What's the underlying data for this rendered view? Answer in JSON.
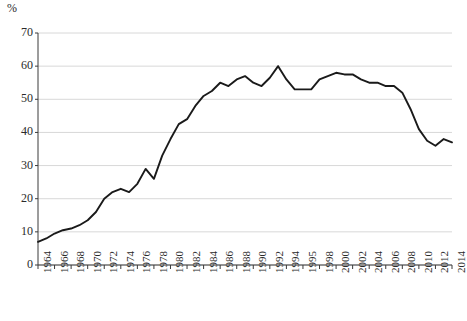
{
  "chart_data": {
    "type": "line",
    "title": "",
    "xlabel": "",
    "ylabel": "%",
    "ylim": [
      0,
      70
    ],
    "xlim": [
      1964,
      2014
    ],
    "grid": true,
    "legend": false,
    "y_ticks": [
      70,
      60,
      50,
      40,
      30,
      20,
      10,
      0
    ],
    "x_tick_labels": [
      "1964",
      "1966",
      "1968",
      "1970",
      "1972",
      "1974",
      "1976",
      "1978",
      "1980",
      "1982",
      "1984",
      "1986",
      "1988",
      "1990",
      "1992",
      "1994",
      "1995",
      "1998",
      "2000",
      "2002",
      "2004",
      "2006",
      "2008",
      "2010",
      "2012",
      "2014"
    ],
    "line_color": "#1a1a1a",
    "grid_color": "#d8d8d8",
    "x": [
      1964,
      1965,
      1966,
      1967,
      1968,
      1969,
      1970,
      1971,
      1972,
      1973,
      1974,
      1975,
      1976,
      1977,
      1978,
      1979,
      1980,
      1981,
      1982,
      1983,
      1984,
      1985,
      1986,
      1987,
      1988,
      1989,
      1990,
      1991,
      1992,
      1993,
      1994,
      1995,
      1996,
      1997,
      1998,
      1999,
      2000,
      2001,
      2002,
      2003,
      2004,
      2005,
      2006,
      2007,
      2008,
      2009,
      2010,
      2011,
      2012,
      2013,
      2014
    ],
    "values": [
      7,
      8,
      9.5,
      10.5,
      11,
      12,
      13.5,
      16,
      20,
      22,
      23,
      22,
      24.5,
      29,
      26,
      33,
      38,
      42.5,
      44,
      48,
      51,
      52.5,
      55,
      54,
      56,
      57,
      55,
      54,
      56.5,
      60,
      56,
      53,
      53,
      53,
      56,
      57,
      58,
      57.5,
      57.5,
      56,
      55,
      55,
      54,
      54,
      52,
      47,
      41,
      37.5,
      36,
      38,
      37
    ]
  },
  "axis": {
    "unit_label": "%"
  },
  "header": {
    "clipped_title": ""
  }
}
